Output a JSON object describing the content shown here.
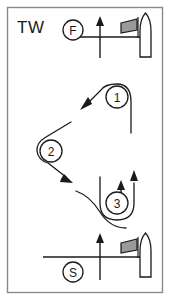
{
  "diagram": {
    "wind_label": "TW",
    "background_color": "#ffffff",
    "frame_color": "#8a8a8a",
    "ink_color": "#1a1a1a",
    "flag_fill_color": "#9a9a9a",
    "marks": [
      {
        "id": "mark-1",
        "label": "1",
        "cx": 117,
        "cy": 97,
        "r": 11
      },
      {
        "id": "mark-2",
        "label": "2",
        "cx": 51,
        "cy": 151,
        "r": 11
      },
      {
        "id": "mark-3",
        "label": "3",
        "cx": 117,
        "cy": 203,
        "r": 11
      }
    ],
    "endpoints": [
      {
        "id": "finish",
        "label": "F",
        "cx": 73,
        "cy": 30,
        "r": 10
      },
      {
        "id": "start",
        "label": "S",
        "cx": 73,
        "cy": 272,
        "r": 10
      }
    ],
    "gates": [
      {
        "id": "finish-line",
        "label": "F",
        "line_y": 37
      },
      {
        "id": "start-line",
        "label": "S",
        "line_y": 257
      }
    ],
    "legs": [
      {
        "from": "start",
        "to": "mark-3",
        "direction": "upwind"
      },
      {
        "from": "mark-3",
        "to": "mark-1",
        "direction": "upwind"
      },
      {
        "from": "mark-1",
        "to": "mark-2",
        "direction": "downwind-left"
      },
      {
        "from": "mark-2",
        "to": "mark-3",
        "direction": "downwind-right"
      },
      {
        "from": "mark-3",
        "to": "finish",
        "direction": "upwind"
      }
    ]
  }
}
